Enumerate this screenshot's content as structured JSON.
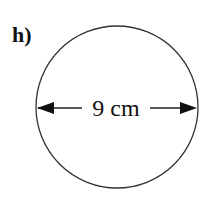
{
  "figure": {
    "label": "h)",
    "shape": "circle",
    "dimension_label": "9 cm",
    "dimension_type": "diameter",
    "colors": {
      "stroke": "#333333",
      "background": "#ffffff"
    }
  }
}
